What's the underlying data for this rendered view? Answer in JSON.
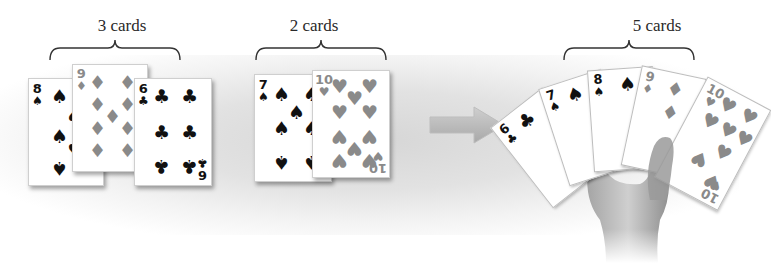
{
  "groups": [
    {
      "label": "3 cards",
      "cards": [
        {
          "rank": "8",
          "suit": "♠",
          "color": "black"
        },
        {
          "rank": "9",
          "suit": "♦",
          "color": "gray"
        },
        {
          "rank": "6",
          "suit": "♣",
          "color": "black"
        }
      ]
    },
    {
      "label": "2 cards",
      "cards": [
        {
          "rank": "7",
          "suit": "♠",
          "color": "black"
        },
        {
          "rank": "10",
          "suit": "♥",
          "color": "gray"
        }
      ]
    },
    {
      "label": "5 cards",
      "cards": [
        {
          "rank": "6",
          "suit": "♣",
          "color": "black"
        },
        {
          "rank": "7",
          "suit": "♠",
          "color": "black"
        },
        {
          "rank": "8",
          "suit": "♠",
          "color": "black"
        },
        {
          "rank": "9",
          "suit": "♦",
          "color": "gray"
        },
        {
          "rank": "10",
          "suit": "♥",
          "color": "gray"
        }
      ]
    }
  ],
  "arrow": {
    "icon": "right-arrow-icon",
    "color": "#b5b5b5"
  },
  "colors": {
    "black_suit": "#111111",
    "red_suit_gray": "#8a8a8a",
    "background_shade": "#d6d6d6"
  }
}
